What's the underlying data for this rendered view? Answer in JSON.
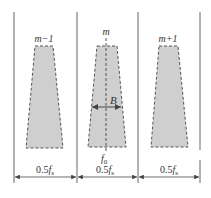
{
  "diagram": {
    "type": "channel spectrum diagram",
    "colors": {
      "fill": "#cfcfcf",
      "stroke": "#555555",
      "line": "#666666",
      "background": "#ffffff"
    },
    "channels": [
      {
        "id": "m-1",
        "label": "m−1"
      },
      {
        "id": "m",
        "label": "m"
      },
      {
        "id": "m+1",
        "label": "m+1"
      }
    ],
    "bandwidth_label": "B",
    "center_frequency": {
      "base": "f",
      "sub": "0"
    },
    "spacing_labels": [
      {
        "coef": "0.5",
        "base": "f",
        "sub": "s"
      },
      {
        "coef": "0.5",
        "base": "f",
        "sub": "s"
      },
      {
        "coef": "0.5",
        "base": "f",
        "sub": "s"
      }
    ]
  }
}
